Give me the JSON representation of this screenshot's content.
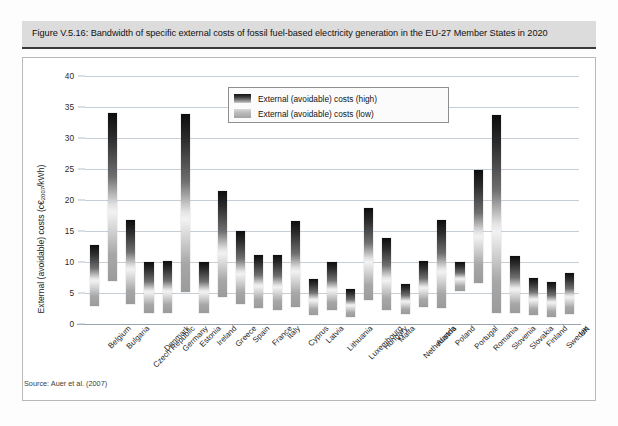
{
  "figure": {
    "title": "Figure V.5.16: Bandwidth of specific external costs of fossil fuel-based electricity generation in the EU-27 Member States in 2020",
    "source": "Source: Auer et al. (2007)"
  },
  "axis": {
    "y_title_main": "External (avoidable) costs (c€",
    "y_title_sub": "2007",
    "y_title_tail": "/kWh)",
    "y_ticks": [
      "0",
      "5",
      "10",
      "15",
      "20",
      "25",
      "30",
      "35",
      "40"
    ]
  },
  "legend": {
    "items": [
      {
        "label": "External (avoidable) costs (high)",
        "swatch": "gradient-high"
      },
      {
        "label": "External (avoidable) costs (low)",
        "swatch": "gradient-low"
      }
    ]
  },
  "colors": {
    "title_band": "#dcdcdc",
    "title_rule": "#3a3a3a",
    "gridline": "#c6cfd8",
    "bar_high": "#0d0d0d",
    "bar_low": "#9b9b9b",
    "plot_background": "#ffffff"
  },
  "chart_data": {
    "type": "bar",
    "title": "Bandwidth of specific external costs of fossil fuel-based electricity generation in the EU-27 Member States in 2020",
    "subtitle": "",
    "xlabel": "",
    "ylabel": "External (avoidable) costs (c€2007/kWh)",
    "ylim": [
      0,
      40
    ],
    "yticks": [
      0,
      5,
      10,
      15,
      20,
      25,
      30,
      35,
      40
    ],
    "grid": true,
    "legend_position": "inside-top-center",
    "value_unit": "c€2007/kWh",
    "bar_style": "floating range bar (low to high)",
    "categories": [
      "Belgium",
      "Bulgaria",
      "Czech Republic",
      "Denmark",
      "Germany",
      "Estonia",
      "Ireland",
      "Greece",
      "Spain",
      "France",
      "Italy",
      "Cyprus",
      "Latvia",
      "Lithuania",
      "Luxembourg",
      "Hungary",
      "Malta",
      "Netherlands",
      "Austria",
      "Poland",
      "Portugal",
      "Romania",
      "Slovenia",
      "Slovakia",
      "Finland",
      "Sweden",
      "UK"
    ],
    "series": [
      {
        "name": "External (avoidable) costs (low)",
        "values": [
          2.9,
          6.9,
          3.3,
          1.8,
          1.8,
          5.2,
          1.8,
          4.3,
          3.2,
          2.6,
          2.3,
          2.8,
          1.5,
          2.2,
          1.2,
          3.9,
          2.2,
          1.6,
          2.8,
          2.6,
          5.4,
          6.6,
          1.8,
          1.8,
          1.4,
          1.2,
          1.6
        ]
      },
      {
        "name": "External (avoidable) costs (high)",
        "values": [
          12.8,
          34.0,
          16.7,
          10.0,
          10.2,
          33.8,
          10.0,
          21.5,
          15.0,
          11.2,
          11.1,
          16.6,
          7.2,
          10.0,
          5.6,
          18.7,
          13.9,
          6.4,
          10.2,
          16.7,
          10.0,
          24.8,
          33.7,
          10.9,
          7.4,
          6.8,
          8.2
        ]
      }
    ]
  }
}
